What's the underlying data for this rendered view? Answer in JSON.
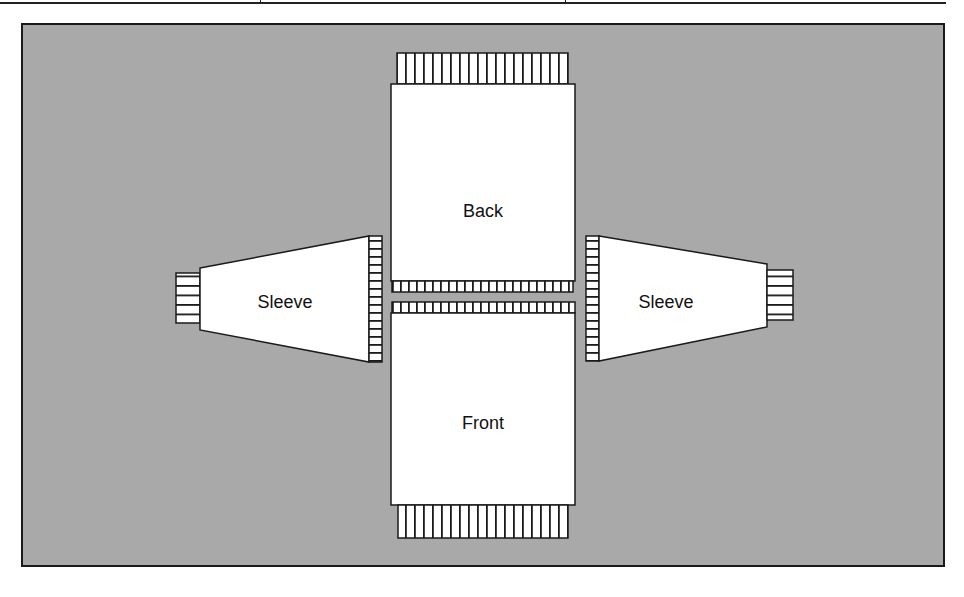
{
  "diagram": {
    "title": "",
    "background_color": "#a9a9a9",
    "piece_fill": "#ffffff",
    "outline_color": "#1a1a1a",
    "pieces": [
      {
        "id": "back",
        "label": "Back"
      },
      {
        "id": "front",
        "label": "Front"
      },
      {
        "id": "left-sleeve",
        "label": "Sleeve"
      },
      {
        "id": "right-sleeve",
        "label": "Sleeve"
      }
    ],
    "labels": {
      "back": "Back",
      "front": "Front",
      "left_sleeve": "Sleeve",
      "right_sleeve": "Sleeve"
    }
  }
}
